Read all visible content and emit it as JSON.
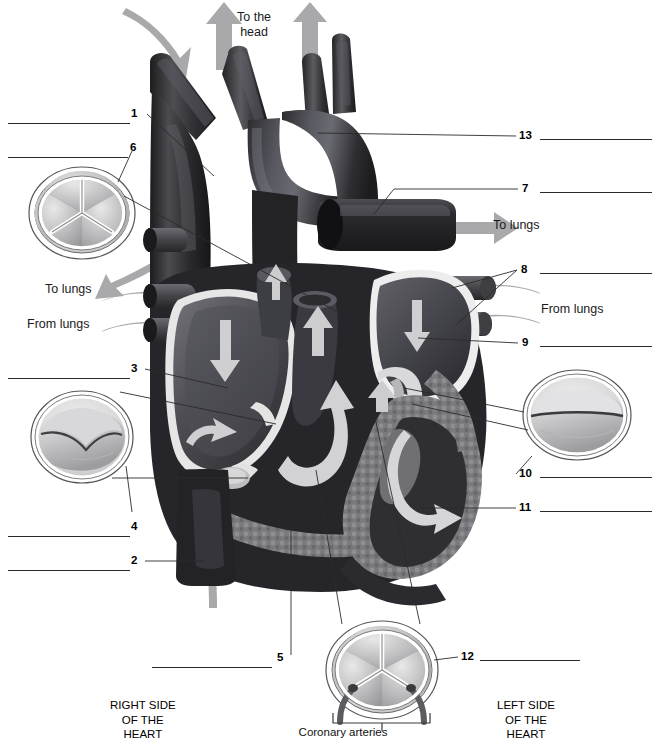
{
  "figure": {
    "type": "labeled-anatomical-diagram"
  },
  "colors": {
    "ink": "#2b2b2b",
    "paper": "#ffffff",
    "vessel_dark": "#2a2a2c",
    "vessel_mid": "#4a4a4d",
    "chamber_dark": "#3c3c3f",
    "muscle_mid": "#7b7b7e",
    "endocardium_light": "#e2e2e2",
    "valve_fill": "#b9b9bb",
    "arrow_grey": "#a6a6a8",
    "inset_outline": "#4d4d4f"
  },
  "callouts": [
    {
      "id": "1",
      "number": "1",
      "side": "left",
      "label_x": 131,
      "label_y": 108,
      "blank_x": 8,
      "blank_y": 123,
      "blank_w": 122,
      "leader": "M148,119 L190,160"
    },
    {
      "id": "6",
      "number": "6",
      "side": "left",
      "label_x": 130,
      "label_y": 142,
      "blank_x": 8,
      "blank_y": 157,
      "blank_w": 120,
      "leader": "M135,155 L118,183"
    },
    {
      "id": "3",
      "number": "3",
      "side": "left",
      "label_x": 131,
      "label_y": 363,
      "blank_x": 8,
      "blank_y": 378,
      "blank_w": 122,
      "leader": "M146,372 L196,387"
    },
    {
      "id": "4",
      "number": "4",
      "side": "left",
      "label_x": 131,
      "label_y": 521,
      "blank_x": 8,
      "blank_y": 536,
      "blank_w": 122,
      "leader": "M133,518 L113,487"
    },
    {
      "id": "2",
      "number": "2",
      "side": "left",
      "label_x": 131,
      "label_y": 555,
      "blank_x": 8,
      "blank_y": 570,
      "blank_w": 122,
      "leader": "M146,563 L196,563"
    },
    {
      "id": "5",
      "number": "5",
      "side": "bottom",
      "label_x": 277,
      "label_y": 652,
      "blank_x": 152,
      "blank_y": 667,
      "blank_w": 120,
      "leader": "M294,658 L294,528"
    },
    {
      "id": "13",
      "number": "13",
      "side": "right",
      "label_x": 519,
      "label_y": 130,
      "blank_x": 540,
      "blank_y": 139,
      "blank_w": 112,
      "leader": "M517,136 L320,136"
    },
    {
      "id": "7",
      "number": "7",
      "side": "right",
      "label_x": 522,
      "label_y": 183,
      "blank_x": 540,
      "blank_y": 192,
      "blank_w": 112,
      "leader": "M518,189 L388,222"
    },
    {
      "id": "8",
      "number": "8",
      "side": "right",
      "label_x": 521,
      "label_y": 264,
      "blank_x": 540,
      "blank_y": 273,
      "blank_w": 112,
      "leader": "M518,270 L452,286"
    },
    {
      "id": "9",
      "number": "9",
      "side": "right",
      "label_x": 522,
      "label_y": 337,
      "blank_x": 540,
      "blank_y": 346,
      "blank_w": 112,
      "leader": "M518,343 L430,343"
    },
    {
      "id": "10",
      "number": "10",
      "side": "right",
      "label_x": 519,
      "label_y": 468,
      "blank_x": 540,
      "blank_y": 477,
      "blank_w": 112,
      "leader": "M517,474 L508,455"
    },
    {
      "id": "11",
      "number": "11",
      "side": "right",
      "label_x": 519,
      "label_y": 502,
      "blank_x": 540,
      "blank_y": 511,
      "blank_w": 112,
      "leader": "M517,508 L427,508"
    },
    {
      "id": "12",
      "number": "12",
      "side": "right",
      "label_x": 461,
      "label_y": 651,
      "blank_x": 480,
      "blank_y": 660,
      "blank_w": 100,
      "leader": "M458,657 L434,657"
    }
  ],
  "flow_annotations": [
    {
      "id": "to-the-head",
      "text_line1": "To the",
      "text_line2": "head",
      "x": 237,
      "y": 10,
      "align": "center"
    },
    {
      "id": "to-lungs-right",
      "text_line1": "To lungs",
      "text_line2": "",
      "x": 493,
      "y": 218,
      "align": "left"
    },
    {
      "id": "to-lungs-left",
      "text_line1": "To lungs",
      "text_line2": "",
      "x": 45,
      "y": 282,
      "align": "left"
    },
    {
      "id": "from-lungs-left",
      "text_line1": "From lungs",
      "text_line2": "",
      "x": 27,
      "y": 317,
      "align": "left"
    },
    {
      "id": "from-lungs-right",
      "text_line1": "From lungs",
      "text_line2": "",
      "x": 541,
      "y": 302,
      "align": "left"
    }
  ],
  "side_captions": [
    {
      "id": "right-side",
      "lines": [
        "RIGHT SIDE",
        "OF THE",
        "HEART"
      ],
      "x": 110,
      "y": 698
    },
    {
      "id": "left-side",
      "lines": [
        "LEFT SIDE",
        "OF THE",
        "HEART"
      ],
      "x": 497,
      "y": 698
    }
  ],
  "coronary_caption": {
    "text": "Coronary arteries",
    "x": 343,
    "y": 726
  },
  "insets": [
    {
      "id": "inset-semilunar-pulmonary",
      "cx": 82,
      "cy": 213,
      "rx": 52,
      "ry": 45,
      "valve_type": "semilunar-tricuspid-cusps"
    },
    {
      "id": "inset-av-right",
      "cx": 82,
      "cy": 437,
      "rx": 50,
      "ry": 45,
      "valve_type": "bicuspid-flaps"
    },
    {
      "id": "inset-av-left",
      "cx": 577,
      "cy": 415,
      "rx": 53,
      "ry": 44,
      "valve_type": "bicuspid-flaps"
    },
    {
      "id": "inset-semilunar-aortic",
      "cx": 382,
      "cy": 670,
      "rx": 55,
      "ry": 48,
      "valve_type": "semilunar-with-coronary-ostia"
    }
  ]
}
